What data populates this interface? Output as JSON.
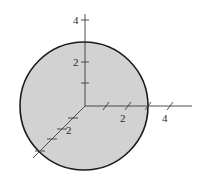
{
  "diagram": {
    "type": "3d-axes-with-sphere",
    "colors": {
      "sphere_fill": "#d2d2d2",
      "sphere_stroke": "#1a1a1a",
      "axis": "#3a3a3a",
      "background": "#ffffff"
    },
    "sphere": {
      "cx": 84,
      "cy": 106,
      "r": 64
    },
    "origin": {
      "x": 85,
      "y": 106
    },
    "axes": {
      "z": {
        "label_4": "4",
        "label_2": "2"
      },
      "y": {
        "label_2": "2",
        "label_4": "4"
      },
      "x": {
        "label_2": "2"
      }
    }
  }
}
